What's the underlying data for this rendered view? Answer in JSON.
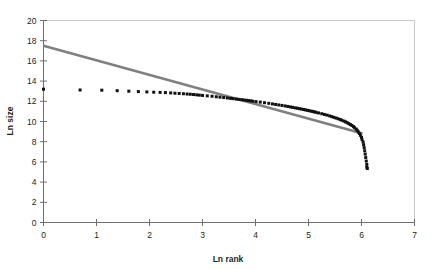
{
  "chart_data": {
    "type": "scatter",
    "title": "",
    "subtitle": "",
    "xlabel": "Ln rank",
    "ylabel": "Ln size",
    "xlim": [
      0,
      7
    ],
    "ylim": [
      0,
      20
    ],
    "xticks": [
      "0",
      "1",
      "2",
      "3",
      "4",
      "5",
      "6",
      "7"
    ],
    "yticks": [
      "0",
      "2",
      "4",
      "6",
      "8",
      "10",
      "12",
      "14",
      "16",
      "18",
      "20"
    ],
    "grid": false,
    "legend": null,
    "annotations": [],
    "series": [
      {
        "name": "Observed rank-size data",
        "type": "scatter",
        "marker": "square",
        "color": "#111111",
        "points": [
          [
            0.0,
            13.2
          ],
          [
            0.69,
            13.12
          ],
          [
            1.1,
            13.1
          ],
          [
            1.39,
            13.05
          ],
          [
            1.61,
            13.0
          ],
          [
            1.79,
            12.96
          ],
          [
            1.95,
            12.93
          ],
          [
            2.08,
            12.9
          ],
          [
            2.2,
            12.88
          ],
          [
            2.3,
            12.86
          ],
          [
            2.4,
            12.83
          ],
          [
            2.48,
            12.8
          ],
          [
            2.56,
            12.78
          ],
          [
            2.64,
            12.75
          ],
          [
            2.71,
            12.72
          ],
          [
            2.77,
            12.7
          ],
          [
            2.83,
            12.67
          ],
          [
            2.89,
            12.64
          ],
          [
            2.94,
            12.61
          ],
          [
            3.0,
            12.58
          ],
          [
            3.09,
            12.54
          ],
          [
            3.18,
            12.5
          ],
          [
            3.26,
            12.45
          ],
          [
            3.33,
            12.41
          ],
          [
            3.4,
            12.37
          ],
          [
            3.47,
            12.33
          ],
          [
            3.53,
            12.29
          ],
          [
            3.58,
            12.26
          ],
          [
            3.64,
            12.22
          ],
          [
            3.69,
            12.19
          ],
          [
            3.74,
            12.16
          ],
          [
            3.78,
            12.13
          ],
          [
            3.83,
            12.1
          ],
          [
            3.87,
            12.07
          ],
          [
            3.91,
            12.04
          ],
          [
            3.95,
            12.01
          ],
          [
            4.01,
            11.97
          ],
          [
            4.09,
            11.92
          ],
          [
            4.17,
            11.86
          ],
          [
            4.25,
            11.8
          ],
          [
            4.32,
            11.74
          ],
          [
            4.38,
            11.69
          ],
          [
            4.44,
            11.64
          ],
          [
            4.5,
            11.59
          ],
          [
            4.56,
            11.54
          ],
          [
            4.61,
            11.49
          ],
          [
            4.66,
            11.44
          ],
          [
            4.7,
            11.4
          ],
          [
            4.75,
            11.35
          ],
          [
            4.79,
            11.31
          ],
          [
            4.83,
            11.27
          ],
          [
            4.87,
            11.23
          ],
          [
            4.91,
            11.19
          ],
          [
            4.94,
            11.15
          ],
          [
            4.98,
            11.11
          ],
          [
            5.01,
            11.07
          ],
          [
            5.05,
            11.03
          ],
          [
            5.08,
            10.99
          ],
          [
            5.11,
            10.95
          ],
          [
            5.14,
            10.91
          ],
          [
            5.19,
            10.85
          ],
          [
            5.25,
            10.77
          ],
          [
            5.3,
            10.7
          ],
          [
            5.35,
            10.63
          ],
          [
            5.4,
            10.55
          ],
          [
            5.44,
            10.48
          ],
          [
            5.48,
            10.41
          ],
          [
            5.52,
            10.34
          ],
          [
            5.56,
            10.27
          ],
          [
            5.6,
            10.19
          ],
          [
            5.63,
            10.12
          ],
          [
            5.67,
            10.04
          ],
          [
            5.7,
            9.96
          ],
          [
            5.73,
            9.88
          ],
          [
            5.76,
            9.79
          ],
          [
            5.79,
            9.7
          ],
          [
            5.82,
            9.6
          ],
          [
            5.85,
            9.49
          ],
          [
            5.87,
            9.38
          ],
          [
            5.9,
            9.25
          ],
          [
            5.92,
            9.12
          ],
          [
            5.94,
            8.97
          ],
          [
            5.96,
            8.81
          ],
          [
            5.98,
            8.63
          ],
          [
            6.0,
            8.43
          ],
          [
            6.01,
            8.21
          ],
          [
            6.03,
            7.97
          ],
          [
            6.04,
            7.7
          ],
          [
            6.05,
            7.41
          ],
          [
            6.06,
            7.1
          ],
          [
            6.07,
            6.77
          ],
          [
            6.08,
            6.43
          ],
          [
            6.09,
            6.08
          ],
          [
            6.1,
            5.75
          ],
          [
            6.1,
            5.48
          ],
          [
            6.11,
            5.35
          ]
        ]
      },
      {
        "name": "Fitted trend line",
        "type": "line",
        "color": "#808080",
        "points": [
          [
            0.0,
            17.5
          ],
          [
            6.02,
            8.8
          ]
        ]
      }
    ]
  }
}
